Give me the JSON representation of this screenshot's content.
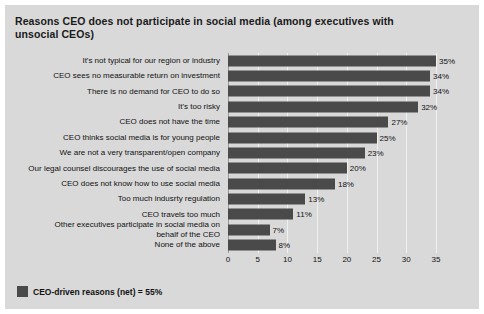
{
  "chart_data": {
    "type": "bar",
    "orientation": "horizontal",
    "title": "Reasons CEO does not participate in social media (among executives with unsocial CEOs)",
    "xlabel": "",
    "ylabel": "",
    "xlim": [
      0,
      35
    ],
    "xticks": [
      0,
      5,
      10,
      15,
      20,
      25,
      30,
      35
    ],
    "grid": true,
    "legend_position": "bottom-left",
    "value_suffix": "%",
    "categories": [
      "It's not typical for our region or industry",
      "CEO sees no measurable return on investment",
      "There is no demand for CEO to do so",
      "It's too risky",
      "CEO does not have the time",
      "CEO thinks social media is for young people",
      "We are not a very transparent/open company",
      "Our legal counsel discourages the use of social media",
      "CEO does not know how to use social media",
      "Too much indusrty regulation",
      "CEO travels too much",
      "Other executives participate in social media on\nbehalf of the CEO",
      "None of the above"
    ],
    "values": [
      35,
      34,
      34,
      32,
      27,
      25,
      23,
      20,
      18,
      13,
      11,
      7,
      8
    ],
    "value_labels": [
      "35%",
      "34%",
      "34%",
      "32%",
      "27%",
      "25%",
      "23%",
      "20%",
      "18%",
      "13%",
      "11%",
      "7%",
      "8%"
    ],
    "bar_color": "#4a4a4a",
    "panel_color": "#d9d9d9"
  },
  "legend": {
    "label": "CEO-driven reasons (net) = 55%",
    "swatch_color": "#4a4a4a"
  }
}
